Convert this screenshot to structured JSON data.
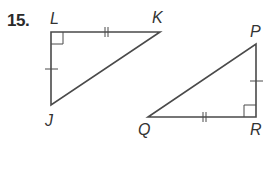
{
  "problem": {
    "number": "15."
  },
  "triangle_1": {
    "name": "triangle-JKL",
    "vertices": {
      "L": "L",
      "K": "K",
      "J": "J"
    },
    "right_angle_at": "L",
    "marks": {
      "LK": "double-tick",
      "LJ": "single-tick"
    }
  },
  "triangle_2": {
    "name": "triangle-PQR",
    "vertices": {
      "P": "P",
      "Q": "Q",
      "R": "R"
    },
    "right_angle_at": "R",
    "marks": {
      "QR": "double-tick",
      "PR": "single-tick"
    }
  },
  "colors": {
    "line": "#4a4a4a",
    "text": "#333333"
  }
}
